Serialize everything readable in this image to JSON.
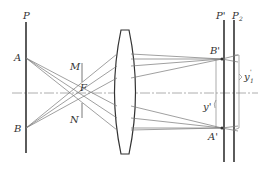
{
  "diagram": {
    "colors": {
      "thick_line": "#333333",
      "ray": "#777777",
      "axis": "#999999",
      "bracket": "#888888"
    },
    "labels": {
      "P": "P",
      "P_prime": "P'",
      "P2": "P",
      "P2_sub": "2",
      "A": "A",
      "B": "B",
      "M": "M",
      "F": "F",
      "N": "N",
      "B_prime": "B'",
      "A_prime": "A'",
      "y_prime": "y'",
      "y1_prime": "y",
      "y1_prime_sub": "1",
      "y1_prime_sup": "'"
    }
  }
}
